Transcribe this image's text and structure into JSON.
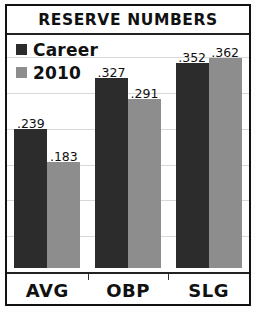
{
  "chart_data": {
    "type": "bar",
    "title": "RESERVE NUMBERS",
    "xlabel": "",
    "ylabel": "",
    "categories": [
      "AVG",
      "OBP",
      "SLG"
    ],
    "series": [
      {
        "name": "Career",
        "color": "#2c2c2c",
        "values": [
          0.239,
          0.327,
          0.352
        ],
        "labels": [
          ".239",
          ".327",
          ".352"
        ]
      },
      {
        "name": "2010",
        "color": "#8d8d8d",
        "values": [
          0.183,
          0.291,
          0.362
        ],
        "labels": [
          ".183",
          ".291",
          ".362"
        ]
      }
    ],
    "ylim": [
      0,
      0.37
    ],
    "grid": true,
    "legend_position": "top-left",
    "data_labels": true
  },
  "legend": {
    "items": [
      {
        "label": "Career",
        "swatch": "#2c2c2c"
      },
      {
        "label": "2010",
        "swatch": "#8d8d8d"
      }
    ]
  },
  "colors": {
    "career": "#2c2c2c",
    "season": "#8d8d8d",
    "frame": "#111111",
    "gridline": "#d8d8d8"
  }
}
